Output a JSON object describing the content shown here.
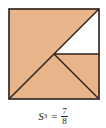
{
  "figure": {
    "square": {
      "x": 9,
      "y": 9,
      "size": 90
    },
    "colors": {
      "shaded": "#E8B48A",
      "unshaded": "#FFFFFF",
      "stroke": "#2a1f1a"
    },
    "regions": [
      {
        "name": "shaded-upper-left-triangle",
        "points": "9,9 99,9 9,99",
        "fill": "shaded"
      },
      {
        "name": "shaded-lower-triangle",
        "points": "9,99 54,54 99,99",
        "fill": "shaded"
      },
      {
        "name": "shaded-right-small-triangle",
        "points": "54,54 99,54 99,99",
        "fill": "shaded"
      },
      {
        "name": "unshaded-triangle",
        "points": "54,54 99,9 99,54",
        "fill": "unshaded"
      }
    ],
    "lines": [
      {
        "name": "main-diagonal",
        "x1": 9,
        "y1": 99,
        "x2": 99,
        "y2": 9
      },
      {
        "name": "horizontal-segment",
        "x1": 54,
        "y1": 54,
        "x2": 99,
        "y2": 54
      },
      {
        "name": "center-to-corner-segment",
        "x1": 54,
        "y1": 54,
        "x2": 99,
        "y2": 99
      }
    ]
  },
  "caption": {
    "symbol": "S",
    "subscript": "3",
    "equals": "=",
    "numerator": "7",
    "denominator": "8"
  }
}
